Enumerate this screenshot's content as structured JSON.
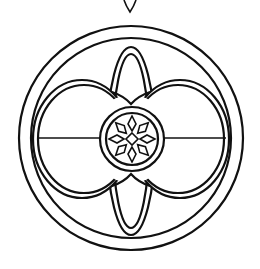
{
  "artwork": {
    "subject": "circular ornament line art",
    "stroke_color": "#111111",
    "background_color": "#ffffff",
    "elements": [
      "hanging-loop-tip",
      "outer-ring",
      "inner-ring",
      "vertical-ellipse",
      "twin-lens-ellipses",
      "horizontal-divider",
      "center-medallion",
      "eight-petal-flower"
    ]
  }
}
